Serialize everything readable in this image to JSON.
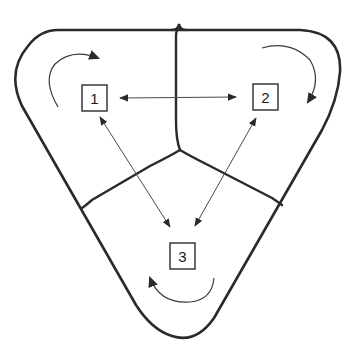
{
  "diagram": {
    "type": "three-region cycle diagram",
    "regions": [
      {
        "id": "region-1",
        "label": "1",
        "cycle_direction": "clockwise"
      },
      {
        "id": "region-2",
        "label": "2",
        "cycle_direction": "clockwise"
      },
      {
        "id": "region-3",
        "label": "3",
        "cycle_direction": "counterclockwise"
      }
    ],
    "links": [
      {
        "from": "1",
        "to": "2",
        "bidirectional": true
      },
      {
        "from": "1",
        "to": "3",
        "bidirectional": true
      },
      {
        "from": "2",
        "to": "3",
        "bidirectional": true
      }
    ],
    "colors": {
      "stroke": "#2a2a2a",
      "background": "#ffffff"
    }
  }
}
